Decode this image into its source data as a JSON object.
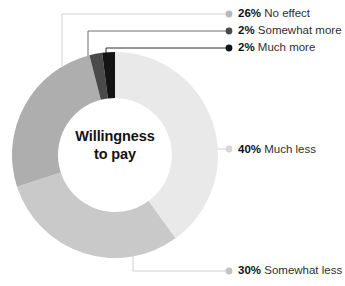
{
  "chart_data": {
    "type": "pie",
    "variant": "donut",
    "title": "Willingness to pay",
    "center_label_line1": "Willingness",
    "center_label_line2": "to pay",
    "xlabel": "",
    "ylabel": "",
    "legend_position": "callout-labels",
    "grid": false,
    "units": "percent",
    "start_angle_deg": 0,
    "direction": "clockwise",
    "categories": [
      "Much less",
      "Somewhat less",
      "No effect",
      "Somewhat more",
      "Much more"
    ],
    "values": [
      40,
      30,
      26,
      2,
      2
    ],
    "labels": [
      "40% Much less",
      "30% Somewhat less",
      "26% No effect",
      "2% Somewhat more",
      "2% Much more"
    ],
    "colors": [
      "#e9e9e9",
      "#c9c9c9",
      "#aeaeae",
      "#4a4a4a",
      "#141414"
    ],
    "slices": [
      {
        "category": "Much less",
        "value": 40,
        "pct_text": "40%",
        "label": "Much less",
        "color": "#e9e9e9"
      },
      {
        "category": "Somewhat less",
        "value": 30,
        "pct_text": "30%",
        "label": "Somewhat less",
        "color": "#c9c9c9"
      },
      {
        "category": "No effect",
        "value": 26,
        "pct_text": "26%",
        "label": "No effect",
        "color": "#aeaeae"
      },
      {
        "category": "Somewhat more",
        "value": 2,
        "pct_text": "2%",
        "label": "Somewhat more",
        "color": "#4a4a4a"
      },
      {
        "category": "Much more",
        "value": 2,
        "pct_text": "2%",
        "label": "Much more",
        "color": "#141414"
      }
    ]
  },
  "legend": {
    "items": [
      {
        "pct": "26%",
        "label": "No effect",
        "dot_color": "#b9b9b9"
      },
      {
        "pct": "2%",
        "label": "Somewhat more",
        "dot_color": "#4a4a4a"
      },
      {
        "pct": "2%",
        "label": "Much more",
        "dot_color": "#141414"
      },
      {
        "pct": "40%",
        "label": "Much less",
        "dot_color": "#d8d8d8"
      },
      {
        "pct": "30%",
        "label": "Somewhat less",
        "dot_color": "#c2c2c2"
      }
    ]
  },
  "colors": {
    "background": "#ffffff",
    "leader_light": "#d2d2d2",
    "leader_mid": "#8a8a8a",
    "leader_dark": "#3a3a3a",
    "text": "#2b2b2b",
    "text_bold": "#111111"
  }
}
